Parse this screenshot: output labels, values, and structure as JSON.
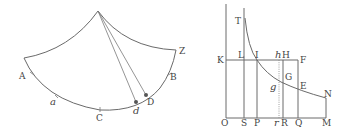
{
  "figure_left": {
    "title": "Cycloidal pendulum figure",
    "labels": {
      "A": "A",
      "a": "a",
      "C": "C",
      "d": "d",
      "D": "D",
      "B": "B",
      "Z": "Z"
    }
  },
  "figure_right": {
    "title": "Hyperbolic area figure",
    "labels": {
      "T": "T",
      "K": "K",
      "L": "L",
      "I": "I",
      "h": "h",
      "H": "H",
      "F": "F",
      "G": "G",
      "g": "g",
      "E": "E",
      "N": "N",
      "O": "O",
      "S": "S",
      "P": "P",
      "r": "r",
      "R": "R",
      "Q": "Q",
      "M": "M"
    }
  },
  "colors": {
    "line": "#6a6a6a",
    "text": "#444444",
    "background": "#ffffff"
  }
}
